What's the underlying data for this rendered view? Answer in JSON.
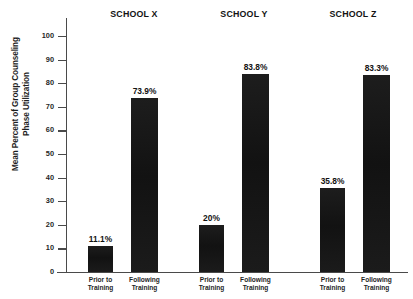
{
  "chart_data": {
    "type": "bar",
    "title": "",
    "xlabel": "",
    "ylabel": "Mean Percent of Group Counseling\nPhase Utilization",
    "ylim": [
      0,
      100
    ],
    "ytick_labels": [
      "0",
      "10",
      "20",
      "30",
      "40",
      "50",
      "60",
      "70",
      "80",
      "90",
      "100"
    ],
    "ytick_values": [
      0,
      10,
      20,
      30,
      40,
      50,
      60,
      70,
      80,
      90,
      100
    ],
    "grid": false,
    "legend": "none",
    "groups": [
      "SCHOOL X",
      "SCHOOL Y",
      "SCHOOL Z"
    ],
    "categories": [
      "Prior to\nTraining",
      "Following\nTraining"
    ],
    "bars": [
      {
        "group": "SCHOOL X",
        "category": "Prior to\nTraining",
        "value": 11.1,
        "label": "11.1%"
      },
      {
        "group": "SCHOOL X",
        "category": "Following\nTraining",
        "value": 73.9,
        "label": "73.9%"
      },
      {
        "group": "SCHOOL Y",
        "category": "Prior to\nTraining",
        "value": 20.0,
        "label": "20%"
      },
      {
        "group": "SCHOOL Y",
        "category": "Following\nTraining",
        "value": 83.8,
        "label": "83.8%"
      },
      {
        "group": "SCHOOL Z",
        "category": "Prior to\nTraining",
        "value": 35.8,
        "label": "35.8%"
      },
      {
        "group": "SCHOOL Z",
        "category": "Following\nTraining",
        "value": 83.3,
        "label": "83.3%"
      }
    ],
    "colors": {
      "bar": "#171717",
      "axis": "#4a4a4a",
      "text": "#1f1f1f",
      "background": "#ffffff"
    }
  },
  "axis": {
    "y_title": "Mean Percent of Group Counseling\nPhase Utilization"
  },
  "headings": {
    "school_x": "SCHOOL X",
    "school_y": "SCHOOL Y",
    "school_z": "SCHOOL Z"
  },
  "ticks": {
    "t0": "0",
    "t10": "10",
    "t20": "20",
    "t30": "30",
    "t40": "40",
    "t50": "50",
    "t60": "60",
    "t70": "70",
    "t80": "80",
    "t90": "90",
    "t100": "100"
  },
  "bar_labels": {
    "x_prior": "11.1%",
    "x_following": "73.9%",
    "y_prior": "20%",
    "y_following": "83.8%",
    "z_prior": "35.8%",
    "z_following": "83.3%"
  },
  "captions": {
    "prior": "Prior to\nTraining",
    "following": "Following\nTraining"
  }
}
